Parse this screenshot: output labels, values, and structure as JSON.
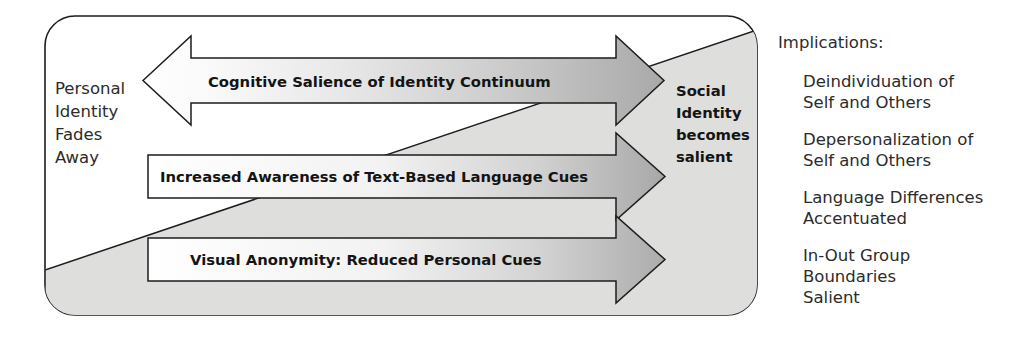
{
  "diagram": {
    "title_hidden": "",
    "container": {
      "name": "sider-model-container"
    },
    "left_label": {
      "lines": [
        "Personal",
        "Identity",
        "Fades",
        "Away"
      ]
    },
    "right_label": {
      "lines": [
        "Social",
        "Identity",
        "becomes",
        "salient"
      ]
    },
    "arrows": [
      {
        "id": "cognitive-salience-arrow",
        "label": "Cognitive Salience of Identity Continuum",
        "direction": "double"
      },
      {
        "id": "increased-awareness-arrow",
        "label": "Increased Awareness of Text-Based Language Cues",
        "direction": "right"
      },
      {
        "id": "visual-anonymity-arrow",
        "label": "Visual Anonymity: Reduced Personal Cues",
        "direction": "right"
      }
    ],
    "implications": {
      "heading": "Implications:",
      "items": [
        {
          "lines": [
            "Deindividuation of",
            "Self and Others"
          ]
        },
        {
          "lines": [
            "Depersonalization of",
            "Self and Others"
          ]
        },
        {
          "lines": [
            "Language Differences",
            "Accentuated"
          ]
        },
        {
          "lines": [
            "In-Out Group",
            "Boundaries",
            "Salient"
          ]
        }
      ]
    },
    "colors": {
      "background": "#ffffff",
      "stroke": "#1d1d1d",
      "wedge_fill": "#dededd",
      "arrow_gray": "#b3b3b3",
      "arrow_white": "#ffffff",
      "text_dark": "#141414",
      "text_body": "#2b2b2b"
    }
  }
}
